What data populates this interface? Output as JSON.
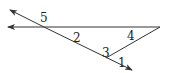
{
  "diagram": {
    "type": "geometry-angles",
    "stroke_color": "#333333",
    "labels": {
      "angle1": "1",
      "angle2": "2",
      "angle3": "3",
      "angle4": "4",
      "angle5": "5"
    }
  }
}
